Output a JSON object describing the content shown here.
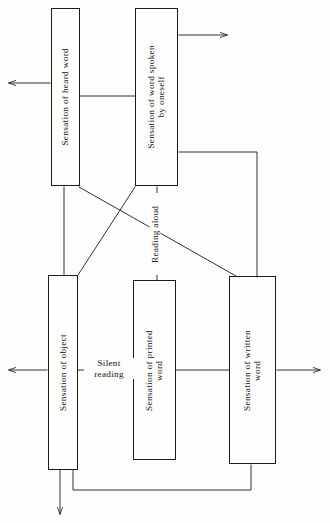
{
  "diagram": {
    "background_color": "#fdfdfc",
    "line_color": "#1b1b1b",
    "text_color": "#141414",
    "nodes": [
      {
        "id": "heard-word",
        "label": "Sensation of heard word"
      },
      {
        "id": "spoken-word",
        "label": "Sensation of word spoken\nby oneself"
      },
      {
        "id": "object",
        "label": "Sensation of object"
      },
      {
        "id": "printed-word",
        "label": "Sensation of printed\nword"
      },
      {
        "id": "written-word",
        "label": "Sensation of written\nword"
      }
    ],
    "edge_labels": [
      {
        "id": "reading-aloud",
        "label": "Reading aloud"
      },
      {
        "id": "silent-reading",
        "label": "Silent\nreading"
      }
    ],
    "arrows": [
      {
        "id": "heard-word-out-left",
        "direction": "left"
      },
      {
        "id": "spoken-word-out-right",
        "direction": "right"
      },
      {
        "id": "object-out-left",
        "direction": "left"
      },
      {
        "id": "written-word-out-right",
        "direction": "right"
      },
      {
        "id": "object-out-down",
        "direction": "down"
      }
    ]
  }
}
